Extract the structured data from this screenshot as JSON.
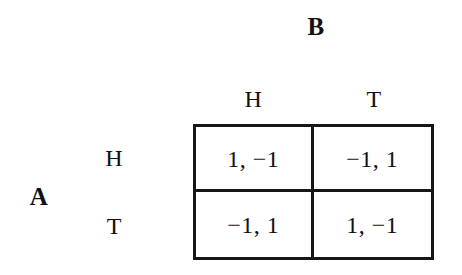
{
  "figure": {
    "type": "normal-form-game-payoff-matrix",
    "row_player_label": "A",
    "column_player_label": "B"
  },
  "column_headers": [
    {
      "label": "H"
    },
    {
      "label": "T"
    }
  ],
  "row_headers": [
    {
      "label": "H"
    },
    {
      "label": "T"
    }
  ],
  "cells": [
    {
      "id": "cell-H-H",
      "text": "1, −1"
    },
    {
      "id": "cell-H-T",
      "text": "−1, 1"
    },
    {
      "id": "cell-T-H",
      "text": "−1, 1"
    },
    {
      "id": "cell-T-T",
      "text": "1, −1"
    }
  ],
  "chart_data": {
    "type": "table",
    "title": "",
    "row_player": "A",
    "column_player": "B",
    "row_strategies": [
      "H",
      "T"
    ],
    "column_strategies": [
      "H",
      "T"
    ],
    "payoffs": [
      [
        {
          "row": 1,
          "column": -1
        },
        {
          "row": -1,
          "column": 1
        }
      ],
      [
        {
          "row": -1,
          "column": 1
        },
        {
          "row": 1,
          "column": -1
        }
      ]
    ],
    "cell_labels": [
      [
        "1, −1",
        "−1, 1"
      ],
      [
        "−1, 1",
        "1, −1"
      ]
    ],
    "grid": true,
    "legend": "none"
  },
  "colors": {
    "background": "#ffffff",
    "ink": "#111111",
    "border": "#161616"
  }
}
